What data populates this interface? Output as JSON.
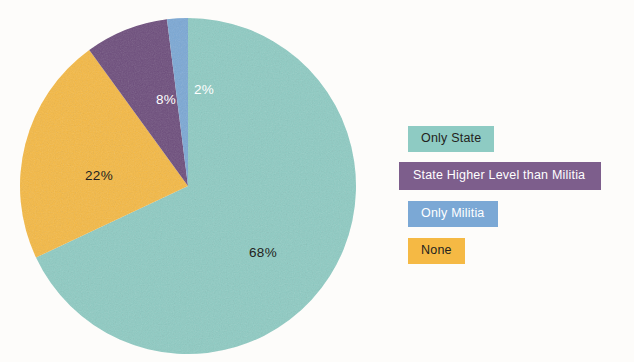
{
  "chart_data": {
    "type": "pie",
    "title": "",
    "subtitle": "",
    "xlabel": "",
    "ylabel": "",
    "legend_position": "right",
    "grid": false,
    "start_angle_deg": 0,
    "direction": "clockwise",
    "categories": [
      "Only State",
      "None",
      "State Higher Level than Militia",
      "Only Militia"
    ],
    "values": [
      68,
      22,
      8,
      2
    ],
    "value_unit": "%",
    "slices": [
      {
        "label": "Only State",
        "value": 68,
        "data_label": "68%",
        "color": "#8ecbc3",
        "label_color": "#231f20",
        "label_x": 244,
        "label_y": 235
      },
      {
        "label": "None",
        "value": 22,
        "data_label": "22%",
        "color": "#f5b944",
        "label_color": "#231f20",
        "label_y": 158,
        "label_x": 80
      },
      {
        "label": "State Higher Level than Militia",
        "value": 8,
        "data_label": "8%",
        "color": "#6d4d7c",
        "label_color": "#ffffff",
        "label_x": 147,
        "label_y": 82
      },
      {
        "label": "Only Militia",
        "value": 2,
        "data_label": "2%",
        "color": "#7ba8d5",
        "label_color": "#ffffff",
        "label_x": 185,
        "label_y": 72
      }
    ]
  },
  "legend": {
    "items": [
      {
        "label": "Only State",
        "swatch_color": "#8ecbc3",
        "text_color": "#231f20"
      },
      {
        "label": "State Higher Level than Militia",
        "swatch_color": "#7d5e8c",
        "text_color": "#ffffff"
      },
      {
        "label": "Only Militia",
        "swatch_color": "#7ba8d5",
        "text_color": "#ffffff"
      },
      {
        "label": "None",
        "swatch_color": "#f5b944",
        "text_color": "#231f20"
      }
    ]
  },
  "canvas": {
    "background_color": "#fdfcfa"
  }
}
